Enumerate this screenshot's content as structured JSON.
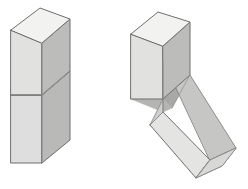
{
  "figure": {
    "background": "#ffffff",
    "width": 248,
    "height": 189,
    "colors": {
      "top_face": "#f2f2f0",
      "front_face": "#e1e1df",
      "front_face_lower": "#dedede",
      "side_face": "#b9b9b7",
      "side_face_lower": "#c2c2c0",
      "wedge_dark": "#a8a8a6",
      "wedge_mid": "#b0b0ae",
      "tilted_top": "#ededeb",
      "tilted_front": "#dcdcda",
      "tilted_side": "#c9c9c7",
      "tilted_end": "#e8e8e6",
      "outline": "#6e6e6e",
      "outline_soft": "#8c8c8c",
      "cut_line": "#757575"
    },
    "stroke_widths": {
      "outline": 1.0,
      "interior": 0.9
    }
  },
  "left_figure": {
    "name": "intact-block",
    "label": "",
    "description": "Upright rectangular prism with a diagonal cut plane visible on the right side face and a horizontal cut line across the front face",
    "polygons": {
      "top_face": "11,30 40,8 70,19 42,43",
      "front_upper": "11,30 42,43 42,95 11,95",
      "front_lower": "11,95 42,95 42,163 11,163",
      "side_upper": "42,43 70,19 70,71 42,95",
      "side_lower": "42,95 70,71 70,140 42,163"
    },
    "cut_lines": {
      "front_horizontal": "11,95 42,95",
      "side_diagonal": "42,95 70,71"
    }
  },
  "right_figure": {
    "name": "hinged-block",
    "label": "",
    "description": "Same prism with the lower section rotated down and to the right about the cut edge, exposing a dark triangular wedge",
    "polygons": {
      "upper_top_face": "131,34 158,12 190,22 163,46",
      "upper_front": "131,34 163,46 163,99 131,99",
      "upper_side": "163,46 190,22 190,75 163,99",
      "wedge_dark": "163,60 190,75 172,108 163,99",
      "wedge_front": "163,99 172,108 163,112 131,99",
      "tilted_top": "163,60 190,75 236,148 210,160",
      "tilted_side": "236,148 210,160 196,178 222,166",
      "tilted_front": "163,112 210,160 196,178 150,125",
      "tilted_left_face": "163,60 163,112 150,125 163,99",
      "tilted_end_face": "210,160 236,148 222,166 196,178"
    },
    "cut_lines": {
      "hinge_edge": "163,60 163,112",
      "wedge_inner": "190,75 172,108",
      "tilted_mid": "163,112 150,125"
    }
  }
}
